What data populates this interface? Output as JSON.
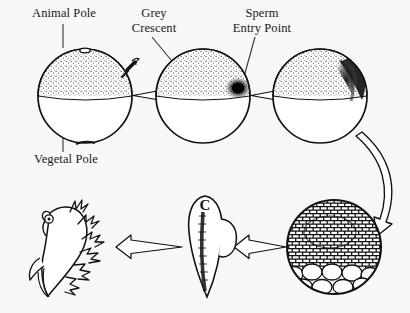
{
  "figure": {
    "background_color": "#f7f7f5",
    "ink_color": "#111111",
    "width": 410,
    "height": 313
  },
  "labels": {
    "animal_pole": "Animal Pole",
    "grey_crescent": "Grey\nCrescent",
    "sperm_entry_point": "Sperm\nEntry Point",
    "vegetal_pole": "Vegetal Pole"
  },
  "stages": [
    {
      "id": "unfertilized-egg",
      "name": "Unfertilized egg",
      "shape": "sphere",
      "cx": 85,
      "cy": 96,
      "r": 47,
      "animal_hemisphere": "stippled-dark",
      "vegetal_hemisphere": "plain-white",
      "features": [
        "animal-pole-marker",
        "equator-line",
        "approaching-sperm"
      ]
    },
    {
      "id": "fertilized-egg",
      "name": "Fertilized egg with sperm entry point",
      "shape": "sphere",
      "cx": 203,
      "cy": 96,
      "r": 47,
      "animal_hemisphere": "stippled-dark",
      "vegetal_hemisphere": "plain-white",
      "features": [
        "sperm-entry-dark-spot-right",
        "equator-line"
      ]
    },
    {
      "id": "grey-crescent-egg",
      "name": "Egg showing grey crescent",
      "shape": "sphere",
      "cx": 320,
      "cy": 96,
      "r": 47,
      "animal_hemisphere": "stippled-dark",
      "vegetal_hemisphere": "plain-white",
      "features": [
        "grey-crescent-upper-right",
        "equator-line"
      ]
    },
    {
      "id": "blastula",
      "name": "Blastula / late cleavage stage",
      "shape": "sphere",
      "cx": 334,
      "cy": 247,
      "r": 47,
      "features": [
        "many-small-animal-cells",
        "large-pale-yolk-cells-bottom"
      ]
    },
    {
      "id": "neurula",
      "name": "Neurula stage embryo",
      "shape": "elongated-oval",
      "cx": 205,
      "cy": 248,
      "features": [
        "neural-groove",
        "head-marking-c",
        "lateral-bulge"
      ]
    },
    {
      "id": "larva",
      "name": "Tadpole larva with external gills",
      "shape": "larva",
      "cx": 62,
      "cy": 248,
      "features": [
        "external-gills",
        "eye",
        "tail-fin",
        "limb-bud"
      ]
    }
  ],
  "arrows": [
    {
      "id": "arrow-1",
      "from": "unfertilized-egg",
      "to": "fertilized-egg",
      "style": "outlined-block",
      "direction": "right"
    },
    {
      "id": "arrow-2",
      "from": "fertilized-egg",
      "to": "grey-crescent-egg",
      "style": "outlined-block",
      "direction": "right"
    },
    {
      "id": "arrow-3",
      "from": "grey-crescent-egg",
      "to": "blastula",
      "style": "outlined-curved",
      "direction": "down"
    },
    {
      "id": "arrow-4",
      "from": "blastula",
      "to": "neurula",
      "style": "outlined-block",
      "direction": "left"
    },
    {
      "id": "arrow-5",
      "from": "neurula",
      "to": "larva",
      "style": "outlined-block",
      "direction": "left"
    }
  ],
  "leader_lines": [
    {
      "id": "leader-animal-pole",
      "label": "animal_pole",
      "type": "vertical"
    },
    {
      "id": "leader-vegetal-pole",
      "label": "vegetal_pole",
      "type": "vertical"
    },
    {
      "id": "leader-grey-crescent",
      "label": "grey_crescent",
      "type": "diagonal"
    },
    {
      "id": "leader-sperm-entry",
      "label": "sperm_entry_point",
      "type": "diagonal"
    }
  ]
}
